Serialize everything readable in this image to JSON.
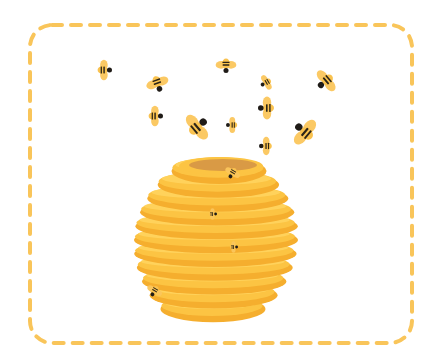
{
  "illustration": {
    "subject": "beehive with bees flying",
    "colors": {
      "background": "#ffffff",
      "frame_dash": "#F9C55A",
      "hive_light": "#FFD45E",
      "hive_mid": "#FCC443",
      "hive_dark": "#F5AE2E",
      "hive_opening": "#D99A45",
      "bee_body": "#F9C24F",
      "bee_wing": "#FBC65C",
      "bee_stripe": "#2B2418",
      "bee_head": "#1F1B17"
    },
    "frame": {
      "x": 30,
      "y": 25,
      "width": 382,
      "height": 318,
      "radius": 22
    },
    "hive": {
      "cx": 216,
      "top": 160,
      "bottom": 312,
      "width": 164,
      "bands": 11
    },
    "flying_bees": [
      {
        "x": 103,
        "y": 70,
        "size": 9,
        "angle": 180
      },
      {
        "x": 157,
        "y": 82,
        "size": 10,
        "angle": 250
      },
      {
        "x": 154,
        "y": 116,
        "size": 9,
        "angle": 180
      },
      {
        "x": 226,
        "y": 64,
        "size": 9,
        "angle": 270
      },
      {
        "x": 267,
        "y": 82,
        "size": 7,
        "angle": 330
      },
      {
        "x": 327,
        "y": 80,
        "size": 11,
        "angle": 320
      },
      {
        "x": 268,
        "y": 108,
        "size": 10,
        "angle": 0
      },
      {
        "x": 196,
        "y": 128,
        "size": 13,
        "angle": 140
      },
      {
        "x": 233,
        "y": 125,
        "size": 7,
        "angle": 0
      },
      {
        "x": 306,
        "y": 133,
        "size": 13,
        "angle": 40
      },
      {
        "x": 267,
        "y": 146,
        "size": 8,
        "angle": 0
      }
    ],
    "hive_bees": [
      {
        "x": 233,
        "y": 172,
        "size": 7,
        "angle": 300
      },
      {
        "x": 212,
        "y": 214,
        "size": 5,
        "angle": 180
      },
      {
        "x": 233,
        "y": 247,
        "size": 5,
        "angle": 180
      },
      {
        "x": 155,
        "y": 290,
        "size": 7,
        "angle": 300
      }
    ]
  }
}
